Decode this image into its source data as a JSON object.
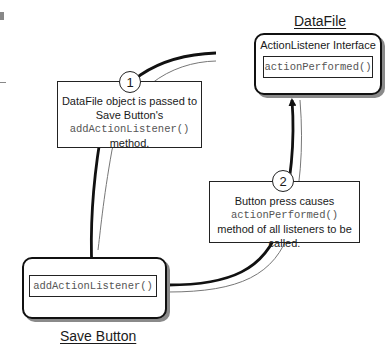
{
  "datafile": {
    "title": "DataFile",
    "interface_label": "ActionListener Interface",
    "method": "actionPerformed()"
  },
  "save_button": {
    "title": "Save Button",
    "method": "addActionListener()"
  },
  "callouts": [
    {
      "number": "1",
      "line1": "DataFile object is passed to",
      "line2": "Save Button's",
      "code": "addActionListener()",
      "line3": "method."
    },
    {
      "number": "2",
      "line1": "Button press causes",
      "code": "actionPerformed()",
      "line2": "method of all listeners to be",
      "line3": "called."
    }
  ],
  "colors": {
    "stroke": "#111111",
    "shadow": "#8a8a8a",
    "code_text": "#555555"
  }
}
